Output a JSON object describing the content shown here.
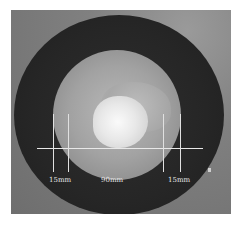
{
  "figure": {
    "labels": {
      "left_margin": "15mm",
      "center_diameter": "90mm",
      "right_margin": "15mm"
    },
    "colors": {
      "background": "#808080",
      "disc": "#262626",
      "specimen": "#a2a2a2",
      "highlight": "#fafafa",
      "annotation": "#e8e8e8"
    }
  }
}
